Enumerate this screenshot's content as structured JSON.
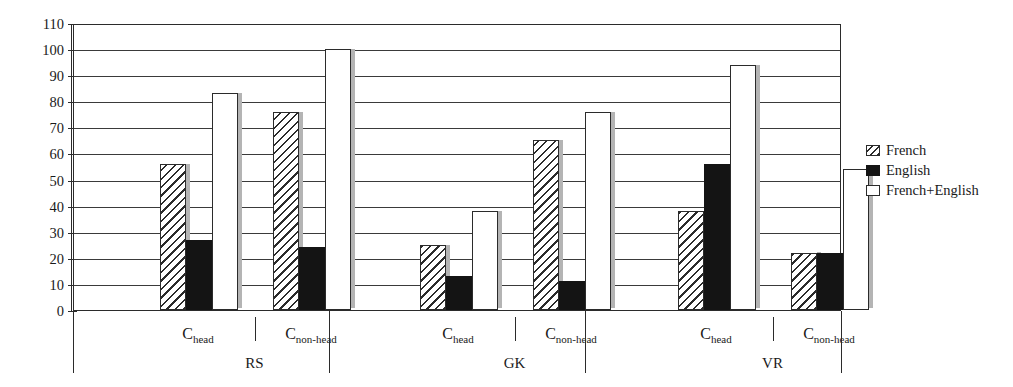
{
  "chart_data": {
    "type": "bar",
    "title": "",
    "xlabel": "",
    "ylabel": "",
    "ylim": [
      0,
      110
    ],
    "ytick_step": 10,
    "yticks": [
      0,
      10,
      20,
      30,
      40,
      50,
      60,
      70,
      80,
      90,
      100,
      110
    ],
    "grid": true,
    "legend_position": "right",
    "categories": [
      "C_head",
      "C_non-head",
      "C_head",
      "C_non-head",
      "C_head",
      "C_non-head"
    ],
    "groups": [
      {
        "group_label": "RS",
        "categories": [
          {
            "label_main": "C",
            "label_sub": "head",
            "values": {
              "French": 56,
              "English": 27,
              "French+English": 83
            }
          },
          {
            "label_main": "C",
            "label_sub": "non-head",
            "values": {
              "French": 76,
              "English": 24,
              "French+English": 100
            }
          }
        ]
      },
      {
        "group_label": "GK",
        "categories": [
          {
            "label_main": "C",
            "label_sub": "head",
            "values": {
              "French": 25,
              "English": 13,
              "French+English": 38
            }
          },
          {
            "label_main": "C",
            "label_sub": "non-head",
            "values": {
              "French": 65,
              "English": 11,
              "French+English": 76
            }
          }
        ]
      },
      {
        "group_label": "VR",
        "categories": [
          {
            "label_main": "C",
            "label_sub": "head",
            "values": {
              "French": 38,
              "English": 56,
              "French+English": 94
            }
          },
          {
            "label_main": "C",
            "label_sub": "non-head",
            "values": {
              "French": 22,
              "English": 22,
              "French+English": 54
            }
          }
        ]
      }
    ],
    "series": [
      {
        "name": "French",
        "values": [
          56,
          76,
          25,
          65,
          38,
          22
        ]
      },
      {
        "name": "English",
        "values": [
          27,
          24,
          13,
          11,
          56,
          22
        ]
      },
      {
        "name": "French+English",
        "values": [
          83,
          100,
          38,
          76,
          94,
          54
        ]
      }
    ]
  },
  "legend": {
    "items": [
      {
        "label": "French",
        "pattern": "hatched"
      },
      {
        "label": "English",
        "pattern": "solid-black"
      },
      {
        "label": "French+English",
        "pattern": "white"
      }
    ]
  },
  "colors": {
    "axis": "#2b2b2b",
    "grid": "#3a3a3a",
    "english_fill": "#141414",
    "both_fill": "#ffffff",
    "shadow": "#b4b4b4"
  }
}
